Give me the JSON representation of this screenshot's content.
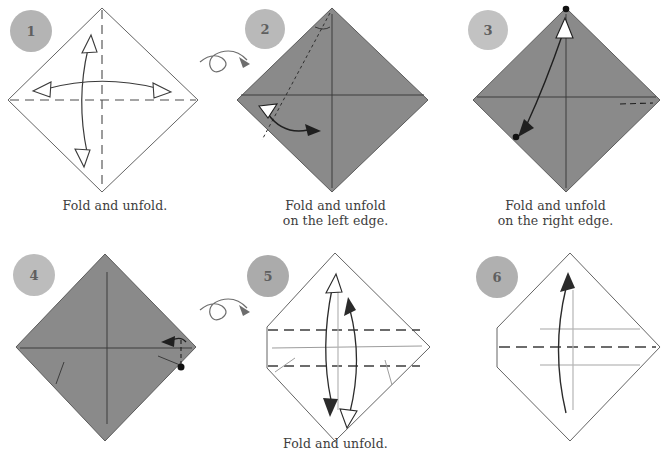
{
  "page": {
    "background_color": "#ffffff",
    "width": 663,
    "height": 462
  },
  "palette": {
    "paper_front": "#8a8a8a",
    "paper_back": "#ffffff",
    "outline": "#555555",
    "crease_dashed": "#4a4a4a",
    "crease_light": "#9a9a9a",
    "arrow": "#2b2b2b",
    "step_circle": "#b4b4b4",
    "step_number": "#5f5f5f",
    "caption_text": "#3d3d3d"
  },
  "steps": [
    {
      "number": "1",
      "caption": "Fold and unfold.",
      "paper_side": "white",
      "creases": [
        "horizontal-dashed",
        "vertical-dashed"
      ],
      "arrows": [
        "double-headed-horizontal",
        "double-headed-vertical"
      ]
    },
    {
      "number": "2",
      "caption": "Fold and unfold\non the left edge.",
      "paper_side": "gray",
      "creases": [
        "horizontal-solid",
        "vertical-solid",
        "diagonal-dotted"
      ],
      "arrows": [
        "double-headed-left-curve"
      ]
    },
    {
      "number": "3",
      "caption": "Fold and unfold\non the right edge.",
      "paper_side": "gray",
      "creases": [
        "horizontal-solid",
        "vertical-solid",
        "short-dashed-right"
      ],
      "arrows": [
        "double-headed-diagonal"
      ],
      "markers": [
        "dot-top",
        "dot-left"
      ]
    },
    {
      "number": "4",
      "caption": "",
      "paper_side": "gray",
      "creases": [
        "horizontal-solid",
        "vertical-solid",
        "short-dashed-right"
      ],
      "arrows": [
        "small-left-arrow"
      ],
      "markers": [
        "dot-right"
      ]
    },
    {
      "number": "5",
      "caption": "Fold and unfold.",
      "paper_side": "white",
      "creases": [
        "upper-horizontal-dashed",
        "lower-horizontal-dashed",
        "center-light-line"
      ],
      "arrows": [
        "double-headed-vertical-left",
        "double-headed-vertical-right"
      ]
    },
    {
      "number": "6",
      "caption": "",
      "paper_side": "white",
      "creases": [
        "center-horizontal-dashed",
        "upper-light-line",
        "lower-light-line"
      ],
      "arrows": [
        "single-up-curve"
      ]
    }
  ],
  "turn_over_symbols": [
    {
      "id": "turn-over-1",
      "between_steps": "1-2"
    },
    {
      "id": "turn-over-2",
      "between_steps": "4-5"
    }
  ]
}
